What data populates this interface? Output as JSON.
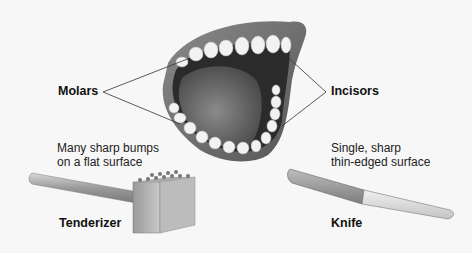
{
  "diagram": {
    "labels": {
      "molars": "Molars",
      "incisors": "Incisors",
      "tenderizer": "Tenderizer",
      "knife": "Knife"
    },
    "descriptions": {
      "tenderizer_line1": "Many sharp bumps",
      "tenderizer_line2": "on a flat surface",
      "knife_line1": "Single, sharp",
      "knife_line2": "thin-edged surface"
    },
    "illustrations": [
      "open-mouth",
      "meat-tenderizer",
      "knife"
    ],
    "colors": {
      "background": "#f7f7f7",
      "lips": "#6e6e6e",
      "mouth_interior": "#2b2b2b",
      "tongue": "#6a6a6a",
      "teeth": "#f2f2f2",
      "leader_lines": "#333333"
    }
  }
}
